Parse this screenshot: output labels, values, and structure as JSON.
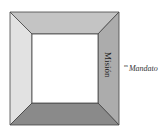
{
  "diagram": {
    "type": "beveled-frame",
    "panels": {
      "top": {
        "label": "",
        "color": "#c4c4c4"
      },
      "left": {
        "label": "",
        "color": "#e2e2e2"
      },
      "right": {
        "label": "Misión",
        "color": "#acacac"
      },
      "bottom": {
        "label": "",
        "color": "#8a8a8a"
      },
      "center": {
        "label": "",
        "color": "#ffffff"
      }
    },
    "outside_label": {
      "superscript": "m",
      "text": "Mandato"
    }
  }
}
